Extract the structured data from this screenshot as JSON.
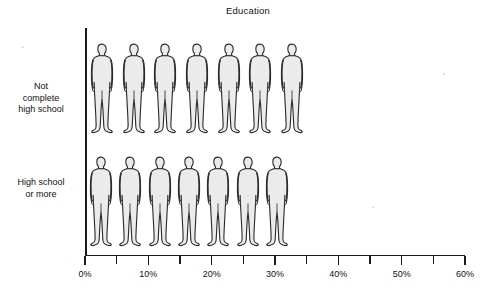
{
  "chart_data": {
    "type": "bar",
    "variant": "pictogram",
    "title": "Education",
    "xlabel": "",
    "ylabel": "",
    "categories": [
      "Not complete high school",
      "High school or more"
    ],
    "values": [
      35,
      32.5
    ],
    "units": "percent",
    "icon": "person-icon",
    "icon_value": 5,
    "icon_counts": [
      7,
      7
    ],
    "xlim": [
      0,
      60
    ],
    "xticks": [
      0,
      5,
      10,
      15,
      20,
      25,
      30,
      35,
      40,
      45,
      50,
      55,
      60
    ],
    "xtick_labels_major": [
      "0%",
      "10%",
      "20%",
      "30%",
      "40%",
      "50%",
      "60%"
    ],
    "xtick_values_major": [
      0,
      10,
      20,
      30,
      40,
      50,
      60
    ],
    "grid": false,
    "legend": "none"
  },
  "title": {
    "text": "Education"
  },
  "axis": {
    "ticks": [
      {
        "value": 0,
        "label": "0%",
        "major": true
      },
      {
        "value": 5,
        "label": "",
        "major": false
      },
      {
        "value": 10,
        "label": "10%",
        "major": true
      },
      {
        "value": 15,
        "label": "",
        "major": false
      },
      {
        "value": 20,
        "label": "20%",
        "major": true
      },
      {
        "value": 25,
        "label": "",
        "major": false
      },
      {
        "value": 30,
        "label": "30%",
        "major": true
      },
      {
        "value": 35,
        "label": "",
        "major": false
      },
      {
        "value": 40,
        "label": "40%",
        "major": true
      },
      {
        "value": 45,
        "label": "",
        "major": false
      },
      {
        "value": 50,
        "label": "50%",
        "major": true
      },
      {
        "value": 55,
        "label": "",
        "major": false
      },
      {
        "value": 60,
        "label": "60%",
        "major": true
      }
    ]
  },
  "rows": [
    {
      "name": "not-complete-high-school",
      "label_lines": [
        "Not",
        "complete",
        "high school"
      ],
      "value": 35,
      "icon_count": 7
    },
    {
      "name": "high-school-or-more",
      "label_lines": [
        "High school",
        "or more"
      ],
      "value": 32.5,
      "icon_count": 7
    }
  ],
  "colors": {
    "figure_fill": "#ebebeb",
    "figure_stroke": "#2b2b2b",
    "axis": "#1b1b1b",
    "text": "#111111",
    "background": "#ffffff"
  }
}
